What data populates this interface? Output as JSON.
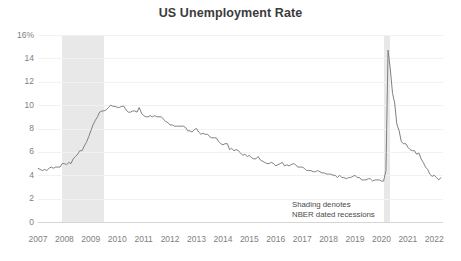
{
  "chart_data": {
    "type": "line",
    "title": "US Unemployment Rate",
    "xlabel": "",
    "ylabel": "",
    "ylim": [
      0,
      16
    ],
    "xlim": [
      2007.0,
      2022.33
    ],
    "grid": true,
    "legend": "none",
    "y_ticks": [
      "16%",
      "14",
      "12",
      "10",
      "8",
      "6",
      "4",
      "2",
      "0"
    ],
    "y_tick_values": [
      16,
      14,
      12,
      10,
      8,
      6,
      4,
      2,
      0
    ],
    "x_ticks": [
      "2007",
      "2008",
      "2009",
      "2010",
      "2011",
      "2012",
      "2013",
      "2014",
      "2015",
      "2016",
      "2017",
      "2018",
      "2019",
      "2020",
      "2021",
      "2022"
    ],
    "x_tick_values": [
      2007,
      2008,
      2009,
      2010,
      2011,
      2012,
      2013,
      2014,
      2015,
      2016,
      2017,
      2018,
      2019,
      2020,
      2021,
      2022
    ],
    "series": [
      {
        "name": "US Unemployment Rate",
        "color": "#808080",
        "x": [
          2007.0,
          2007.08,
          2007.17,
          2007.25,
          2007.33,
          2007.42,
          2007.5,
          2007.58,
          2007.67,
          2007.75,
          2007.83,
          2007.92,
          2008.0,
          2008.08,
          2008.17,
          2008.25,
          2008.33,
          2008.42,
          2008.5,
          2008.58,
          2008.67,
          2008.75,
          2008.83,
          2008.92,
          2009.0,
          2009.08,
          2009.17,
          2009.25,
          2009.33,
          2009.42,
          2009.5,
          2009.58,
          2009.67,
          2009.75,
          2009.83,
          2009.92,
          2010.0,
          2010.08,
          2010.17,
          2010.25,
          2010.33,
          2010.42,
          2010.5,
          2010.58,
          2010.67,
          2010.75,
          2010.83,
          2010.92,
          2011.0,
          2011.08,
          2011.17,
          2011.25,
          2011.33,
          2011.42,
          2011.5,
          2011.58,
          2011.67,
          2011.75,
          2011.83,
          2011.92,
          2012.0,
          2012.08,
          2012.17,
          2012.25,
          2012.33,
          2012.42,
          2012.5,
          2012.58,
          2012.67,
          2012.75,
          2012.83,
          2012.92,
          2013.0,
          2013.08,
          2013.17,
          2013.25,
          2013.33,
          2013.42,
          2013.5,
          2013.58,
          2013.67,
          2013.75,
          2013.83,
          2013.92,
          2014.0,
          2014.08,
          2014.17,
          2014.25,
          2014.33,
          2014.42,
          2014.5,
          2014.58,
          2014.67,
          2014.75,
          2014.83,
          2014.92,
          2015.0,
          2015.08,
          2015.17,
          2015.25,
          2015.33,
          2015.42,
          2015.5,
          2015.58,
          2015.67,
          2015.75,
          2015.83,
          2015.92,
          2016.0,
          2016.08,
          2016.17,
          2016.25,
          2016.33,
          2016.42,
          2016.5,
          2016.58,
          2016.67,
          2016.75,
          2016.83,
          2016.92,
          2017.0,
          2017.08,
          2017.17,
          2017.25,
          2017.33,
          2017.42,
          2017.5,
          2017.58,
          2017.67,
          2017.75,
          2017.83,
          2017.92,
          2018.0,
          2018.08,
          2018.17,
          2018.25,
          2018.33,
          2018.42,
          2018.5,
          2018.58,
          2018.67,
          2018.75,
          2018.83,
          2018.92,
          2019.0,
          2019.08,
          2019.17,
          2019.25,
          2019.33,
          2019.42,
          2019.5,
          2019.58,
          2019.67,
          2019.75,
          2019.83,
          2019.92,
          2020.0,
          2020.08,
          2020.17,
          2020.25,
          2020.33,
          2020.42,
          2020.5,
          2020.58,
          2020.67,
          2020.75,
          2020.83,
          2020.92,
          2021.0,
          2021.08,
          2021.17,
          2021.25,
          2021.33,
          2021.42,
          2021.5,
          2021.58,
          2021.67,
          2021.75,
          2021.83,
          2021.92,
          2022.0,
          2022.08,
          2022.17,
          2022.25
        ],
        "y": [
          4.6,
          4.5,
          4.4,
          4.5,
          4.4,
          4.6,
          4.7,
          4.6,
          4.7,
          4.7,
          4.7,
          5.0,
          5.0,
          4.9,
          5.1,
          5.0,
          5.4,
          5.6,
          5.8,
          6.1,
          6.1,
          6.5,
          6.8,
          7.3,
          7.8,
          8.3,
          8.7,
          9.0,
          9.4,
          9.5,
          9.5,
          9.6,
          9.8,
          10.0,
          9.9,
          9.9,
          9.8,
          9.8,
          9.9,
          9.9,
          9.6,
          9.4,
          9.4,
          9.5,
          9.5,
          9.4,
          9.8,
          9.3,
          9.1,
          9.0,
          9.0,
          9.1,
          9.0,
          9.1,
          9.0,
          9.0,
          9.0,
          8.8,
          8.6,
          8.5,
          8.3,
          8.3,
          8.2,
          8.2,
          8.2,
          8.2,
          8.2,
          8.1,
          7.8,
          7.8,
          7.7,
          7.9,
          8.0,
          7.7,
          7.5,
          7.6,
          7.5,
          7.5,
          7.3,
          7.2,
          7.2,
          7.2,
          6.9,
          6.7,
          6.6,
          6.7,
          6.7,
          6.2,
          6.3,
          6.1,
          6.2,
          6.1,
          5.9,
          5.7,
          5.8,
          5.6,
          5.7,
          5.5,
          5.4,
          5.4,
          5.6,
          5.3,
          5.2,
          5.1,
          5.0,
          5.0,
          5.1,
          5.0,
          4.8,
          4.9,
          5.0,
          5.1,
          4.8,
          4.9,
          4.8,
          4.9,
          5.0,
          4.9,
          4.7,
          4.7,
          4.7,
          4.6,
          4.4,
          4.4,
          4.4,
          4.3,
          4.3,
          4.4,
          4.3,
          4.2,
          4.2,
          4.1,
          4.1,
          4.1,
          4.0,
          4.0,
          3.8,
          4.0,
          3.8,
          3.8,
          3.7,
          3.8,
          3.8,
          3.9,
          4.0,
          3.8,
          3.8,
          3.6,
          3.6,
          3.6,
          3.7,
          3.7,
          3.5,
          3.6,
          3.6,
          3.6,
          3.5,
          3.5,
          4.4,
          14.7,
          13.2,
          11.0,
          10.2,
          8.4,
          7.8,
          6.9,
          6.7,
          6.7,
          6.4,
          6.2,
          6.1,
          6.1,
          5.8,
          5.9,
          5.4,
          5.1,
          4.7,
          4.5,
          4.1,
          3.9,
          4.0,
          3.8,
          3.6,
          3.8
        ]
      }
    ],
    "annotations": [
      {
        "name": "recession-shading-note",
        "line1": "Shading denotes",
        "line2": "NBER dated recessions"
      }
    ],
    "shaded_regions": [
      {
        "name": "recession-2008",
        "start": 2007.92,
        "end": 2009.5,
        "color": "#e8e8e8"
      },
      {
        "name": "recession-2020",
        "start": 2020.08,
        "end": 2020.33,
        "color": "#e8e8e8"
      }
    ]
  }
}
